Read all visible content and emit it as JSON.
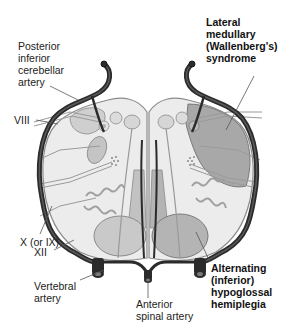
{
  "figure": {
    "labels": {
      "pica": "Posterior\ninferior\ncerebellar\nartery",
      "viii": "VIII",
      "x_ix": "X (or IX)",
      "xii": "XII",
      "vertebral": "Vertebral\nartery",
      "anterior_spinal": "Anterior\nspinal artery",
      "lateral_medullary": "Lateral\nmedullary\n(Wallenberg's)\nsyndrome",
      "alternating": "Alternating\n(inferior)\nhypoglossal\nhemiplegia"
    },
    "colors": {
      "artery": "#2b2b2b",
      "tissue_light": "#ececec",
      "outline": "#8a8a8a",
      "structure": "#c9c9c9",
      "infarct_lateral": "#a8a8a8",
      "infarct_medial": "#b4b4b4",
      "nerve": "#9a9a9a",
      "leader": "#555555"
    }
  }
}
